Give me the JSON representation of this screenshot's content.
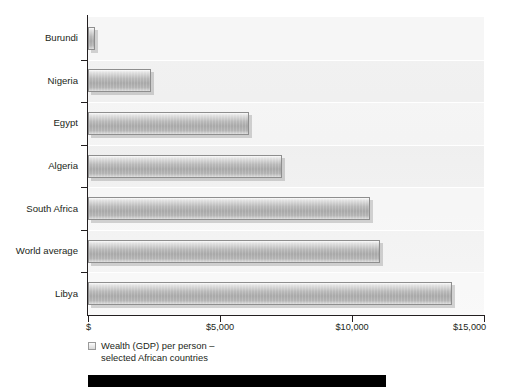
{
  "chart_data": {
    "type": "bar",
    "orientation": "horizontal",
    "title": "",
    "subtitle": "",
    "xlabel": "",
    "ylabel": "",
    "categories": [
      "Burundi",
      "Nigeria",
      "Egypt",
      "Algeria",
      "South Africa",
      "World average",
      "Libya"
    ],
    "values": [
      270,
      2400,
      6100,
      7350,
      10700,
      11050,
      13800
    ],
    "xlim": [
      0,
      15000
    ],
    "xticks": [
      0,
      5000,
      10000,
      15000
    ],
    "xtick_labels": [
      "$",
      "$5,000",
      "$10,000",
      "$15,000"
    ],
    "grid": false,
    "legend": {
      "position": "below-left",
      "entries": [
        {
          "label": "Wealth (GDP) per person –\nselected African countries",
          "swatch": "grey-gradient-square"
        }
      ]
    },
    "series": [
      {
        "name": "Wealth (GDP) per person – selected African countries",
        "values": [
          270,
          2400,
          6100,
          7350,
          10700,
          11050,
          13800
        ]
      }
    ]
  },
  "axis": {
    "x_labels": [
      "$",
      "$5,000",
      "$10,000",
      "$15,000"
    ],
    "y_labels": [
      "Burundi",
      "Nigeria",
      "Egypt",
      "Algeria",
      "South Africa",
      "World average",
      "Libya"
    ]
  },
  "legend": {
    "text": "Wealth (GDP) per person –\nselected African countries"
  },
  "colors": {
    "plot_background": "#f1f1f1",
    "bar_fill_light": "#fbfbfb",
    "bar_fill_dark": "#a8a8a8",
    "bar_border": "#8e8e8e",
    "axis": "#231f20",
    "text": "#231f20",
    "bottom_band": "#000000"
  }
}
